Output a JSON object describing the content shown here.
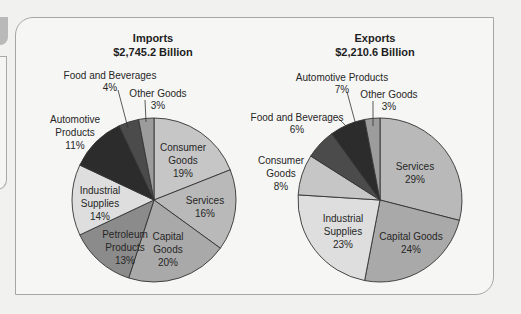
{
  "chart_data": [
    {
      "type": "pie",
      "title": "Imports",
      "subtitle": "$2,745.2 Billion",
      "start": "12 o'clock, clockwise",
      "slices": [
        {
          "label": "Consumer Goods",
          "value": 19,
          "color": "#c6c6c6"
        },
        {
          "label": "Services",
          "value": 16,
          "color": "#b9b9b9"
        },
        {
          "label": "Capital Goods",
          "value": 20,
          "color": "#a9a9a9"
        },
        {
          "label": "Petroleum Products",
          "value": 13,
          "color": "#8b8b8b"
        },
        {
          "label": "Industrial Supplies",
          "value": 14,
          "color": "#dedede"
        },
        {
          "label": "Automotive Products",
          "value": 11,
          "color": "#2c2c2c"
        },
        {
          "label": "Food and Beverages",
          "value": 4,
          "color": "#4b4b4b"
        },
        {
          "label": "Other Goods",
          "value": 3,
          "color": "#9c9c9c"
        }
      ]
    },
    {
      "type": "pie",
      "title": "Exports",
      "subtitle": "$2,210.6 Billion",
      "start": "12 o'clock, clockwise",
      "slices": [
        {
          "label": "Services",
          "value": 29,
          "color": "#b9b9b9"
        },
        {
          "label": "Capital Goods",
          "value": 24,
          "color": "#a9a9a9"
        },
        {
          "label": "Industrial Supplies",
          "value": 23,
          "color": "#dedede"
        },
        {
          "label": "Consumer Goods",
          "value": 8,
          "color": "#c6c6c6"
        },
        {
          "label": "Food and Beverages",
          "value": 6,
          "color": "#4b4b4b"
        },
        {
          "label": "Automotive Products",
          "value": 7,
          "color": "#2c2c2c"
        },
        {
          "label": "Other Goods",
          "value": 3,
          "color": "#9c9c9c"
        }
      ]
    }
  ],
  "imports": {
    "title": "Imports",
    "total": "$2,745.2 Billion",
    "labels": {
      "consumer": [
        "Consumer",
        "Goods",
        "19%"
      ],
      "services": [
        "Services",
        "16%"
      ],
      "capital": [
        "Capital",
        "Goods",
        "20%"
      ],
      "petroleum": [
        "Petroleum",
        "Products",
        "13%"
      ],
      "industrial": [
        "Industrial",
        "Supplies",
        "14%"
      ],
      "automotive": [
        "Automotive",
        "Products",
        "11%"
      ],
      "food": [
        "Food and Beverages",
        "4%"
      ],
      "other": [
        "Other Goods",
        "3%"
      ]
    }
  },
  "exports": {
    "title": "Exports",
    "total": "$2,210.6 Billion",
    "labels": {
      "services": [
        "Services",
        "29%"
      ],
      "capital": [
        "Capital Goods",
        "24%"
      ],
      "industrial": [
        "Industrial",
        "Supplies",
        "23%"
      ],
      "consumer": [
        "Consumer",
        "Goods",
        "8%"
      ],
      "food": [
        "Food and Beverages",
        "6%"
      ],
      "automotive": [
        "Automotive Products",
        "7%"
      ],
      "other": [
        "Other Goods",
        "3%"
      ]
    }
  }
}
